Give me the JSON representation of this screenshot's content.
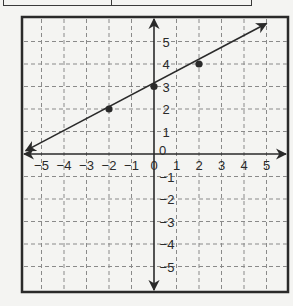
{
  "table_remnant": {
    "columns": 2,
    "cells": [
      "",
      ""
    ]
  },
  "chart_data": {
    "type": "line",
    "title": "",
    "xlabel": "",
    "ylabel": "",
    "xlim": [
      -5,
      5
    ],
    "ylim": [
      -5,
      5
    ],
    "grid": true,
    "grid_style": "dashed",
    "x_tick_labels": [
      "-5",
      "-4",
      "-3",
      "-2",
      "-1",
      "0",
      "1",
      "2",
      "3",
      "4",
      "5"
    ],
    "y_tick_labels": [
      "5",
      "4",
      "3",
      "2",
      "1",
      "0",
      "-1",
      "-2",
      "-3",
      "-4",
      "-5"
    ],
    "axis_origin_labels": {
      "x": "0",
      "y": "0"
    },
    "series": [
      {
        "name": "line",
        "equation": "y = 0.5x + 3",
        "slope": 0.5,
        "intercept": 3,
        "arrows": "both",
        "points": [
          {
            "x": -2,
            "y": 2
          },
          {
            "x": 0,
            "y": 3
          },
          {
            "x": 2,
            "y": 4
          }
        ]
      }
    ],
    "colors": {
      "line": "#2a2a2a",
      "grid": "#8a8a8a",
      "frame": "#2a2a2a",
      "background": "#f4f4f2"
    }
  }
}
